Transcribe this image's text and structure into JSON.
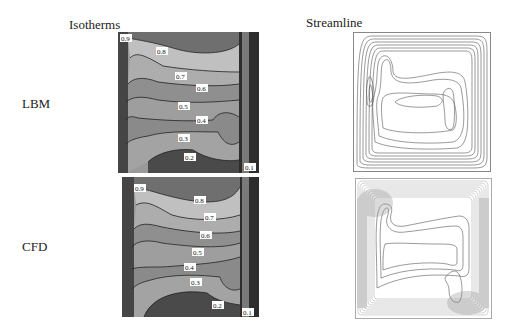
{
  "headers": {
    "isotherms": "Isotherms",
    "streamline": "Streamline"
  },
  "rows": [
    {
      "label": "LBM",
      "isotherm_labels": [
        "0.9",
        "0.8",
        "0.7",
        "0.6",
        "0.5",
        "0.4",
        "0.3",
        "0.2",
        "0.1"
      ]
    },
    {
      "label": "CFD",
      "isotherm_labels": [
        "0.9",
        "0.8",
        "0.7",
        "0.6",
        "0.5",
        "0.4",
        "0.3",
        "0.2",
        "0.1"
      ]
    }
  ],
  "colors": {
    "hot": "#3a3a3a",
    "band_dark": "#6b6b6b",
    "band_light": "#b9b9b9",
    "band_mid": "#8e8e8e",
    "contour_line": "#222222",
    "streamline": "#555555",
    "frame": "#888888"
  }
}
